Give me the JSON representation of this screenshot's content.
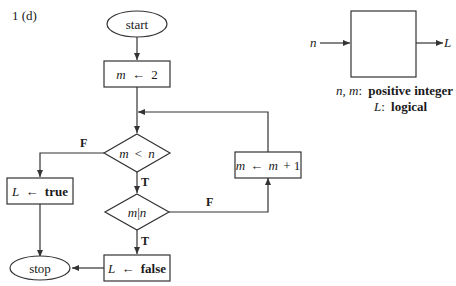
{
  "problem_label": "1 (d)",
  "flowchart": {
    "start": "start",
    "init": {
      "var": "m",
      "arrow": "←",
      "value": "2"
    },
    "cond1": {
      "left": "m",
      "op": "<",
      "right": "n"
    },
    "cond2": {
      "left": "m",
      "op": "|",
      "right": "n"
    },
    "increment": {
      "var": "m",
      "arrow": "←",
      "expr_var": "m",
      "expr_rest": "+ 1"
    },
    "set_true": {
      "var": "L",
      "arrow": "←",
      "value": "true"
    },
    "set_false": {
      "var": "L",
      "arrow": "←",
      "value": "false"
    },
    "stop": "stop",
    "branch_labels": {
      "cond1_false": "F",
      "cond1_true": "T",
      "cond2_false": "F",
      "cond2_true": "T"
    }
  },
  "io_box": {
    "input": "n",
    "output": "L",
    "legend": [
      {
        "vars": "n, m",
        "desc": "positive integer"
      },
      {
        "vars": "L",
        "desc": "logical"
      }
    ]
  }
}
